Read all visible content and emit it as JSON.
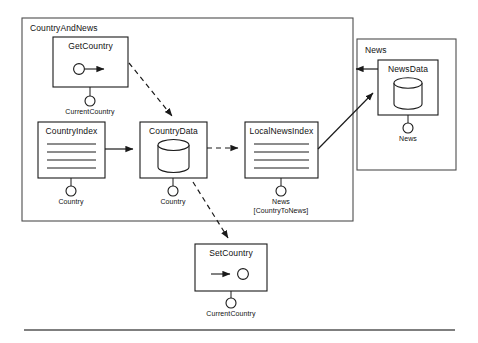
{
  "diagram": {
    "type": "uml-component-package-diagram",
    "packages": [
      {
        "id": "country-and-news",
        "label": "CountryAndNews",
        "x": 22,
        "y": 18,
        "w": 331,
        "h": 203
      },
      {
        "id": "news",
        "label": "News",
        "x": 357,
        "y": 39,
        "w": 99,
        "h": 131
      }
    ],
    "components": [
      {
        "id": "get-country",
        "label": "GetCountry",
        "glyph": "source-operation-icon",
        "x": 53,
        "y": 37,
        "w": 75,
        "h": 50,
        "port": {
          "label": "CurrentCountry",
          "cx": 90,
          "cy": 101
        }
      },
      {
        "id": "country-index",
        "label": "CountryIndex",
        "glyph": "index-lines-icon",
        "x": 38,
        "y": 122,
        "w": 67,
        "h": 56,
        "port": {
          "label": "Country",
          "cx": 71,
          "cy": 191
        }
      },
      {
        "id": "country-data",
        "label": "CountryData",
        "glyph": "database-cylinder-icon",
        "x": 140,
        "y": 122,
        "w": 67,
        "h": 56,
        "port": {
          "label": "Country",
          "cx": 173,
          "cy": 191
        }
      },
      {
        "id": "local-news-index",
        "label": "LocalNewsIndex",
        "glyph": "index-lines-icon",
        "x": 245,
        "y": 122,
        "w": 73,
        "h": 56,
        "port": {
          "label": "News",
          "label2": "[CountryToNews]",
          "cx": 281,
          "cy": 191
        }
      },
      {
        "id": "set-country",
        "label": "SetCountry",
        "glyph": "sink-operation-icon",
        "x": 195,
        "y": 244,
        "w": 72,
        "h": 47,
        "port": {
          "label": "CurrentCountry",
          "cx": 231,
          "cy": 303
        }
      },
      {
        "id": "news-data",
        "label": "NewsData",
        "glyph": "database-cylinder-icon",
        "x": 378,
        "y": 60,
        "w": 60,
        "h": 55,
        "port": {
          "label": "News",
          "cx": 408,
          "cy": 128
        }
      }
    ],
    "connections": [
      {
        "id": "get-country-to-country-data",
        "style": "dashed",
        "from": "get-country",
        "to": "country-data"
      },
      {
        "id": "country-index-to-country-data",
        "style": "solid",
        "from": "country-index",
        "to": "country-data"
      },
      {
        "id": "country-data-to-local-news-index",
        "style": "dashed",
        "from": "country-data",
        "to": "local-news-index"
      },
      {
        "id": "country-data-to-set-country",
        "style": "dashed",
        "from": "country-data",
        "to": "set-country"
      },
      {
        "id": "local-news-index-to-news-data",
        "style": "solid",
        "from": "local-news-index",
        "to": "news-data"
      },
      {
        "id": "news-to-country-and-news",
        "style": "solid",
        "from": "news",
        "to": "country-and-news"
      }
    ],
    "footer_rule": {
      "x1": 24,
      "y1": 330,
      "x2": 455,
      "y2": 330
    },
    "colors": {
      "stroke": "#1a1a1a",
      "background": "#ffffff",
      "package_stroke": "#4d4d4d"
    }
  }
}
